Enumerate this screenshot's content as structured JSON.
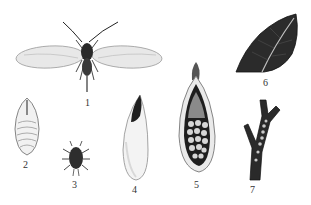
{
  "figure": {
    "panels": [
      {
        "id": "1",
        "label": "1",
        "subject": "winged adult insect"
      },
      {
        "id": "2",
        "label": "2",
        "subject": "pupa"
      },
      {
        "id": "3",
        "label": "3",
        "subject": "nymph"
      },
      {
        "id": "4",
        "label": "4",
        "subject": "cocoon / scale"
      },
      {
        "id": "5",
        "label": "5",
        "subject": "opened scale with eggs"
      },
      {
        "id": "6",
        "label": "6",
        "subject": "infested leaf"
      },
      {
        "id": "7",
        "label": "7",
        "subject": "infested twig"
      }
    ],
    "colors": {
      "ink": "#1a1a1a",
      "mid": "#555555",
      "light": "#cfcfcf",
      "paper": "#ffffff"
    }
  }
}
